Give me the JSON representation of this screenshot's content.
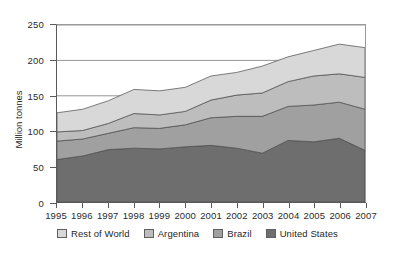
{
  "chart_data": {
    "type": "area",
    "stacked": true,
    "title": "",
    "xlabel": "",
    "ylabel": "Million tonnes",
    "ylim": [
      0,
      250
    ],
    "yticks": [
      0,
      50,
      100,
      150,
      200,
      250
    ],
    "ytick_labels": [
      "0",
      "50",
      "100",
      "150",
      "200",
      "250"
    ],
    "grid": "horizontal",
    "legend_position": "bottom",
    "categories": [
      "1995",
      "1996",
      "1997",
      "1998",
      "1999",
      "2000",
      "2001",
      "2002",
      "2003",
      "2004",
      "2005",
      "2006",
      "2007"
    ],
    "series": [
      {
        "name": "United States",
        "color": "#6e6e6e",
        "values": [
          60,
          65,
          74,
          76,
          75,
          78,
          80,
          76,
          69,
          87,
          85,
          90,
          73
        ]
      },
      {
        "name": "Brazil",
        "color": "#a0a0a0",
        "values": [
          26,
          24,
          23,
          29,
          29,
          31,
          39,
          45,
          52,
          48,
          52,
          51,
          58
        ]
      },
      {
        "name": "Argentina",
        "color": "#bdbdbd",
        "values": [
          13,
          12,
          14,
          20,
          19,
          19,
          25,
          30,
          33,
          35,
          41,
          40,
          45
        ]
      },
      {
        "name": "Rest of World",
        "color": "#d8d8d8",
        "values": [
          27,
          30,
          32,
          34,
          34,
          34,
          34,
          32,
          38,
          35,
          36,
          42,
          42
        ]
      }
    ],
    "cumulative_totals": [
      126,
      131,
      143,
      159,
      157,
      162,
      178,
      183,
      192,
      205,
      214,
      223,
      218
    ],
    "stack_order_bottom_to_top": [
      "United States",
      "Brazil",
      "Argentina",
      "Rest of World"
    ]
  },
  "legend": {
    "items": [
      {
        "label": "Rest of World",
        "color": "#d8d8d8"
      },
      {
        "label": "Argentina",
        "color": "#bdbdbd"
      },
      {
        "label": "Brazil",
        "color": "#a0a0a0"
      },
      {
        "label": "United States",
        "color": "#6e6e6e"
      }
    ]
  },
  "axis": {
    "y_title": "Million tonnes"
  },
  "colors": {
    "axis_line": "#5a5a5a",
    "grid_line": "#8a8a8a",
    "band_outline": "#4a4a4a",
    "text": "#2b2b2b",
    "background": "#ffffff"
  }
}
